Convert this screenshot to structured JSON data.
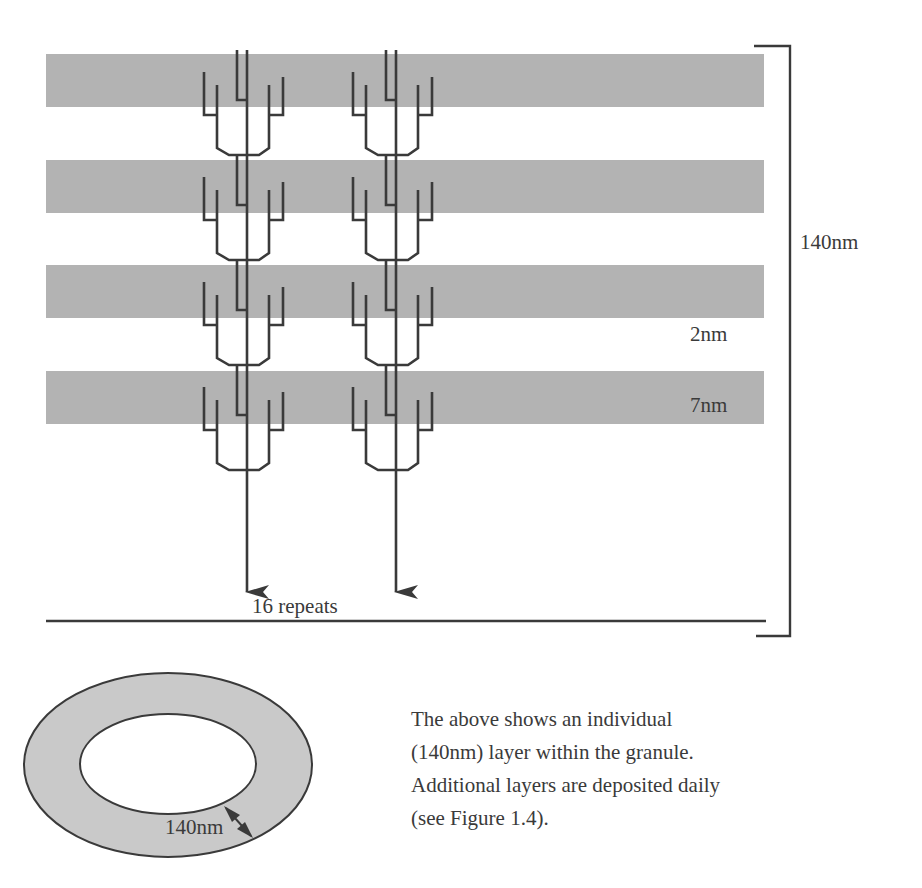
{
  "figure": {
    "layer_diagram": {
      "bands": [
        {
          "y": 54,
          "height": 53
        },
        {
          "y": 160,
          "height": 53
        },
        {
          "y": 265,
          "height": 53
        },
        {
          "y": 371,
          "height": 53
        }
      ],
      "band_color": "#b3b3b3",
      "molecule_columns_x": [
        247,
        396
      ],
      "repeat_label": "16 repeats",
      "total_thickness_label": "140nm",
      "gap_label": "2nm",
      "band_thickness_label": "7nm"
    },
    "cross_section": {
      "ring_fill": "#c9c9c9",
      "thickness_label": "140nm"
    },
    "caption": {
      "lines": [
        "The above shows an individual",
        "(140nm) layer within the granule.",
        "Additional layers are deposited daily",
        "(see Figure 1.4)."
      ]
    }
  }
}
